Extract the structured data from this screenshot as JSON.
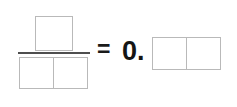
{
  "expression": {
    "type": "fill-in-the-blank-math",
    "fraction": {
      "numerator_blanks": [
        {
          "value": ""
        }
      ],
      "denominator_blanks": [
        {
          "value": ""
        },
        {
          "value": ""
        }
      ]
    },
    "equals_symbol": "=",
    "decimal_prefix": "0.",
    "decimal_blanks": [
      {
        "value": ""
      },
      {
        "value": ""
      }
    ]
  },
  "colors": {
    "background": "#ffffff",
    "box_border": "#b9b9b9",
    "fraction_bar": "#4e4e4e",
    "text": "#151515"
  }
}
